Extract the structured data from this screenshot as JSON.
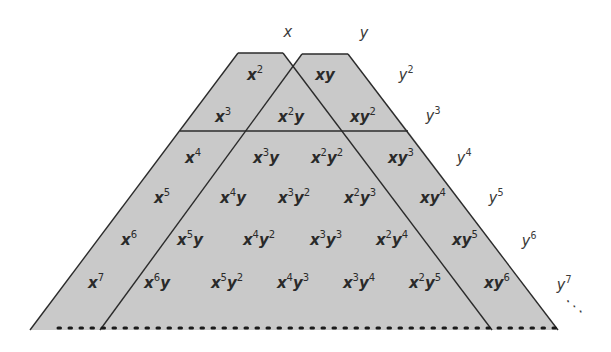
{
  "diagram": {
    "colors": {
      "fill": "#c9c9c9",
      "stroke": "#2b2b2b",
      "text": "#2a2a2a",
      "background": "#ffffff"
    },
    "top_labels": [
      {
        "base": "x",
        "exp": "",
        "x": 288,
        "y": 32
      },
      {
        "base": "y",
        "exp": "",
        "x": 364,
        "y": 33
      }
    ],
    "right_labels": [
      {
        "base": "y",
        "exp": "2",
        "x": 406,
        "y": 75
      },
      {
        "base": "y",
        "exp": "3",
        "x": 433,
        "y": 116
      },
      {
        "base": "y",
        "exp": "4",
        "x": 464,
        "y": 158
      },
      {
        "base": "y",
        "exp": "5",
        "x": 496,
        "y": 198
      },
      {
        "base": "y",
        "exp": "6",
        "x": 529,
        "y": 241
      },
      {
        "base": "y",
        "exp": "7",
        "x": 564,
        "y": 285
      }
    ],
    "ellipsis": {
      "text": "⋰",
      "x": 575,
      "y": 306
    },
    "rows": [
      {
        "degree": 2,
        "y": 75,
        "terms": [
          {
            "text": "x",
            "exp": "2",
            "x": 255
          },
          {
            "text": "xy",
            "exp": "",
            "x": 325
          }
        ]
      },
      {
        "degree": 3,
        "y": 117,
        "terms": [
          {
            "text": "x",
            "exp": "3",
            "x": 223
          },
          {
            "text": "x²y",
            "exp": "",
            "x": 291
          },
          {
            "text": "xy²",
            "exp": "",
            "x": 363
          }
        ]
      },
      {
        "degree": 4,
        "y": 158,
        "terms": [
          {
            "text": "x⁴",
            "x": 193
          },
          {
            "text": "x³y",
            "x": 266
          },
          {
            "text": "x²y²",
            "x": 327
          },
          {
            "text": "xy³",
            "x": 401
          }
        ]
      },
      {
        "degree": 5,
        "y": 198,
        "terms": [
          {
            "text": "x⁵",
            "x": 162
          },
          {
            "text": "x⁴y",
            "x": 233
          },
          {
            "text": "x³y²",
            "x": 294
          },
          {
            "text": "x²y³",
            "x": 360
          },
          {
            "text": "xy⁴",
            "x": 433
          }
        ]
      },
      {
        "degree": 6,
        "y": 240,
        "terms": [
          {
            "text": "x⁶",
            "x": 129
          },
          {
            "text": "x⁵y",
            "x": 190
          },
          {
            "text": "x⁴y²",
            "x": 259
          },
          {
            "text": "x³y³",
            "x": 326
          },
          {
            "text": "x²y⁴",
            "x": 392
          },
          {
            "text": "xy⁵",
            "x": 465
          }
        ]
      },
      {
        "degree": 7,
        "y": 283,
        "terms": [
          {
            "text": "x⁷",
            "x": 96
          },
          {
            "text": "x⁶y",
            "x": 157
          },
          {
            "text": "x⁵y²",
            "x": 227
          },
          {
            "text": "x⁴y³",
            "x": 293
          },
          {
            "text": "x³y⁴",
            "x": 359
          },
          {
            "text": "x²y⁵",
            "x": 425
          },
          {
            "text": "xy⁶",
            "x": 497
          }
        ]
      }
    ]
  }
}
